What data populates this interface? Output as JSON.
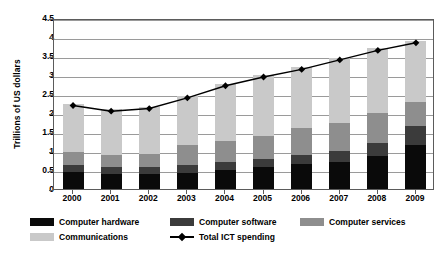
{
  "chart_data": {
    "type": "bar",
    "subtype": "stacked-bar-with-line",
    "title": "",
    "xlabel": "",
    "ylabel": "Trillions of US dollars",
    "ylim": [
      0,
      4.5
    ],
    "ytick_step": 0.5,
    "yticks": [
      "4.5",
      "4",
      "3.5",
      "3",
      "2.5",
      "2",
      "1.5",
      "1",
      "0.5",
      "0"
    ],
    "ytick_values": [
      4.5,
      4,
      3.5,
      3,
      2.5,
      2,
      1.5,
      1,
      0.5,
      0
    ],
    "categories": [
      "2000",
      "2001",
      "2002",
      "2003",
      "2004",
      "2005",
      "2006",
      "2007",
      "2008",
      "2009"
    ],
    "grid": true,
    "legend_position": "bottom",
    "series": [
      {
        "name": "Computer hardware",
        "type": "bar",
        "color": "#0a0a0a",
        "values": [
          0.45,
          0.4,
          0.4,
          0.43,
          0.5,
          0.57,
          0.65,
          0.72,
          0.88,
          1.15
        ]
      },
      {
        "name": "Computer software",
        "type": "bar",
        "color": "#3b3b3b",
        "values": [
          0.17,
          0.17,
          0.18,
          0.2,
          0.22,
          0.23,
          0.25,
          0.28,
          0.32,
          0.5
        ]
      },
      {
        "name": "Computer services",
        "type": "bar",
        "color": "#8e8e8e",
        "values": [
          0.35,
          0.33,
          0.33,
          0.52,
          0.55,
          0.6,
          0.7,
          0.75,
          0.8,
          0.65
        ]
      },
      {
        "name": "Communications",
        "type": "bar",
        "color": "#c9c9c9",
        "values": [
          1.28,
          1.2,
          1.26,
          1.3,
          1.5,
          1.6,
          1.6,
          1.7,
          1.7,
          1.6
        ]
      },
      {
        "name": "Total ICT spending",
        "type": "line",
        "color": "#000000",
        "marker": "diamond",
        "values": [
          2.25,
          2.1,
          2.17,
          2.45,
          2.77,
          3.0,
          3.2,
          3.45,
          3.7,
          3.9
        ]
      }
    ]
  },
  "legend": {
    "entries": [
      {
        "label": "Computer hardware",
        "color": "#0a0a0a",
        "kind": "swatch"
      },
      {
        "label": "Computer software",
        "color": "#3b3b3b",
        "kind": "swatch"
      },
      {
        "label": "Computer services",
        "color": "#8e8e8e",
        "kind": "swatch"
      },
      {
        "label": "Communications",
        "color": "#c9c9c9",
        "kind": "swatch"
      },
      {
        "label": "Total ICT spending",
        "color": "#000000",
        "kind": "line"
      }
    ]
  }
}
